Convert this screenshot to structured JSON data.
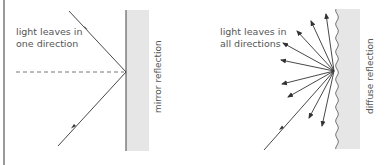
{
  "panels": [
    {
      "name": "mirror",
      "label_lines": [
        "light leaves in",
        "one direction"
      ],
      "surface_label": "mirror reflection"
    },
    {
      "name": "diffuse",
      "label_lines": [
        "light leaves in",
        "all directions"
      ],
      "surface_label": "diffuse reflection"
    }
  ],
  "colors": {
    "wall": "#e6e6e6",
    "ray": "#333333",
    "text": "#555555"
  }
}
